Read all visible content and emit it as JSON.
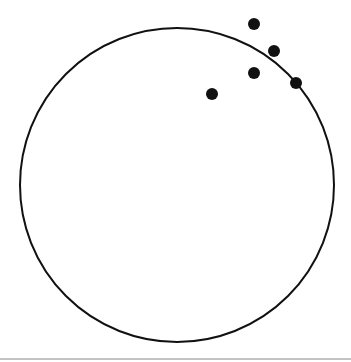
{
  "canvas": {
    "width": 351,
    "height": 362,
    "background": "#ffffff"
  },
  "circle": {
    "cx": 177,
    "cy": 185,
    "r": 157,
    "stroke": "#111111",
    "stroke_width": 2
  },
  "points": [
    {
      "x": 254,
      "y": 24
    },
    {
      "x": 274,
      "y": 51
    },
    {
      "x": 254,
      "y": 73
    },
    {
      "x": 296,
      "y": 83
    },
    {
      "x": 212,
      "y": 94
    }
  ],
  "point_style": {
    "r": 6,
    "fill": "#111111"
  },
  "baseline": {
    "y": 359,
    "color": "#888888"
  }
}
